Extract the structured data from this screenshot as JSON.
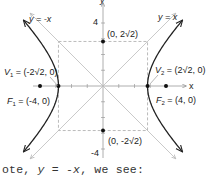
{
  "figure": {
    "type": "hyperbola-graph",
    "equation_context": "x^2/8 - y^2/8 = 1",
    "axes": {
      "x_label": "x",
      "y_label": "y",
      "y_tick_top": "4",
      "y_tick_bottom": "-4",
      "range": [
        -4.5,
        4.5
      ]
    },
    "asymptotes": [
      {
        "label": "y = x",
        "slope": 1
      },
      {
        "label": "y = -x",
        "slope": -1
      }
    ],
    "points": [
      {
        "name": "V1",
        "label_main": "V",
        "label_sub": "1",
        "label_rest": " = (-2√2, 0)",
        "x": -2.828,
        "y": 0
      },
      {
        "name": "V2",
        "label_main": "V",
        "label_sub": "2",
        "label_rest": " = (2√2, 0)",
        "x": 2.828,
        "y": 0
      },
      {
        "name": "F1",
        "label_main": "F",
        "label_sub": "1",
        "label_rest": " = (-4, 0)",
        "x": -4,
        "y": 0
      },
      {
        "name": "F2",
        "label_main": "F",
        "label_sub": "2",
        "label_rest": " = (4, 0)",
        "x": 4,
        "y": 0
      },
      {
        "name": "B1",
        "label_rest": "(0, 2√2)",
        "x": 0,
        "y": 2.828
      },
      {
        "name": "B2",
        "label_rest": "(0, -2√2)",
        "x": 0,
        "y": -2.828
      }
    ],
    "a": 2.828,
    "b": 2.828,
    "colors": {
      "curve": "#222222",
      "asymptote": "#bbbbbb",
      "box": "#aaaaaa",
      "axis": "#999999",
      "point": "#111111"
    }
  },
  "caption": {
    "prefix": "ote, ",
    "var": "y",
    "rest": " = -",
    "var2": "x",
    "suffix": ", we see:"
  }
}
